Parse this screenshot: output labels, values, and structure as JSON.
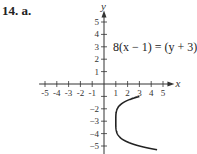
{
  "problem": {
    "number": "14.",
    "part": "a."
  },
  "chart_data": {
    "type": "line",
    "title": "",
    "equation": "8(x − 1) = (y + 3)⁴",
    "xlabel": "x",
    "ylabel": "y",
    "xlim": [
      -5.5,
      5.8
    ],
    "ylim": [
      -5.5,
      6
    ],
    "x_ticks": [
      -5,
      -4,
      -3,
      -2,
      -1,
      1,
      2,
      3,
      4,
      5
    ],
    "y_ticks": [
      -5,
      -4,
      -3,
      -2,
      -1,
      1,
      2,
      3,
      4,
      5
    ],
    "x_tick_labels": [
      "-5",
      "-4",
      "-3",
      "-2",
      "-1",
      "1",
      "2",
      "3",
      "4",
      "5"
    ],
    "y_tick_labels": [
      "-5",
      "-4",
      "-3",
      "-2",
      "1",
      "2",
      "3",
      "4",
      "5"
    ],
    "grid": false,
    "series": [
      {
        "name": "8(x-1)=(y+3)^4",
        "x": "1 + (y+3)^4/8",
        "y_range": [
          -5.3,
          -1.0
        ]
      }
    ]
  }
}
